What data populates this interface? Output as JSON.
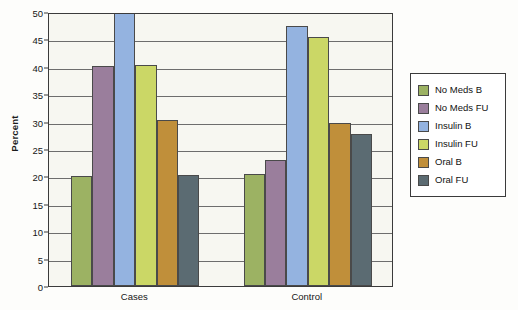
{
  "chart_data": {
    "type": "bar",
    "title": "",
    "subtitle": "",
    "xlabel": "",
    "ylabel": "Percent",
    "categories": [
      "Cases",
      "Control"
    ],
    "ylim": [
      0,
      50
    ],
    "yticks": [
      0,
      5,
      10,
      15,
      20,
      25,
      30,
      35,
      40,
      45,
      50
    ],
    "ytick_labels": [
      "0",
      "5",
      "10",
      "15",
      "20",
      "25",
      "30",
      "35",
      "40",
      "45",
      "50"
    ],
    "grid": true,
    "grid_axis": "y",
    "legend_position": "right-outside",
    "series": [
      {
        "name": "No Meds B",
        "color": "#9cb263",
        "values": [
          20.0,
          20.4
        ]
      },
      {
        "name": "No Meds FU",
        "color": "#9a7e9c",
        "values": [
          40.2,
          23.0
        ]
      },
      {
        "name": "Insulin B",
        "color": "#94b3e0",
        "values": [
          52.0,
          47.5
        ]
      },
      {
        "name": "Insulin FU",
        "color": "#cbd766",
        "values": [
          40.3,
          45.5
        ]
      },
      {
        "name": "Oral B",
        "color": "#c08f3a",
        "values": [
          30.3,
          29.8
        ]
      },
      {
        "name": "Oral FU",
        "color": "#5b6b72",
        "values": [
          20.2,
          27.8
        ]
      }
    ]
  },
  "axis": {
    "y_title": "Percent"
  },
  "legend": {
    "items": [
      {
        "label": "No Meds B",
        "color": "#9cb263"
      },
      {
        "label": "No Meds FU",
        "color": "#9a7e9c"
      },
      {
        "label": "Insulin B",
        "color": "#94b3e0"
      },
      {
        "label": "Insulin FU",
        "color": "#cbd766"
      },
      {
        "label": "Oral B",
        "color": "#c08f3a"
      },
      {
        "label": "Oral FU",
        "color": "#5b6b72"
      }
    ]
  },
  "colors": {
    "plot_background": "#f7f7f1",
    "frame": "#3b3b3b",
    "gridline": "#6d6d6d",
    "text": "#161616",
    "page_background": "#fdfdfb"
  }
}
